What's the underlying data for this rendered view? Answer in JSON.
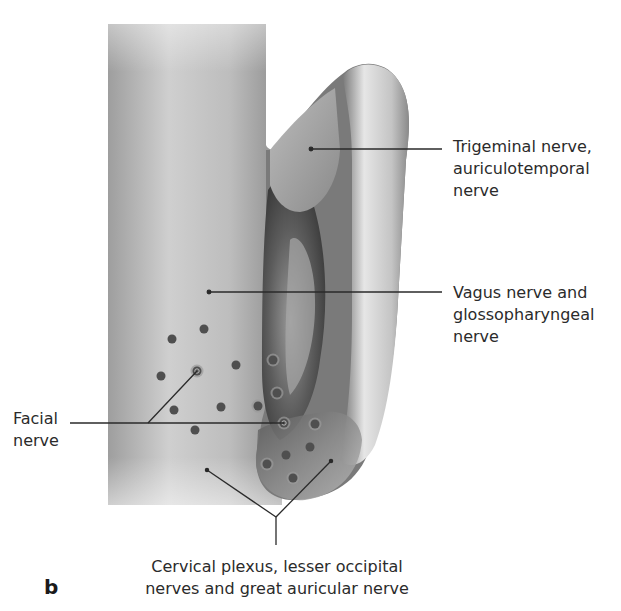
{
  "figure": {
    "panel_letter": "b",
    "labels": {
      "trigeminal": [
        "Trigeminal nerve,",
        "auriculotemporal",
        "nerve"
      ],
      "vagus": [
        "Vagus nerve and",
        "glossopharyngeal",
        "nerve"
      ],
      "facial": [
        "Facial",
        "nerve"
      ],
      "cervical": [
        "Cervical plexus, lesser occipital",
        "nerves and great auricular nerve"
      ]
    },
    "colors": {
      "dot": "#4f4f4f",
      "dot_halo": "#9a9a9a",
      "leader_line": "#2a2a2a",
      "skin_light": "#d8d8d8",
      "skin_dark": "#5a5a5a"
    }
  }
}
